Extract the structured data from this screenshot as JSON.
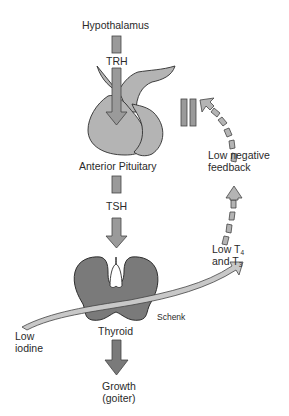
{
  "diagram": {
    "colors": {
      "pituitary_fill": "#b4b4b4",
      "thyroid_fill": "#7a7a7a",
      "arrow_fill": "#9a9a9a",
      "arrow_stroke": "#444444",
      "iodine_band_fill": "#c8c8c8",
      "outline": "#2e2e2e",
      "background": "#ffffff"
    },
    "labels": {
      "hypothalamus": "Hypothalamus",
      "trh": "TRH",
      "anterior_pituitary": "Anterior Pituitary",
      "tsh": "TSH",
      "thyroid": "Thyroid",
      "growth_line1": "Growth",
      "growth_line2": "(goiter)",
      "low_iodine_line1": "Low",
      "low_iodine_line2": "iodine",
      "low_t4_prefix": "Low T",
      "low_t4_sub": "4",
      "and_t3_prefix": "and T",
      "and_t3_sub": "3",
      "low_negative_feedback_line1": "Low negative",
      "low_negative_feedback_line2": "feedback",
      "artist_credit": "Schenk"
    },
    "nodes": [
      {
        "id": "hypothalamus",
        "label": "Hypothalamus"
      },
      {
        "id": "anterior_pituitary",
        "label": "Anterior Pituitary"
      },
      {
        "id": "thyroid",
        "label": "Thyroid"
      },
      {
        "id": "goiter",
        "label": "Growth (goiter)"
      }
    ],
    "edges": [
      {
        "from": "hypothalamus",
        "to": "anterior_pituitary",
        "label": "TRH",
        "style": "solid"
      },
      {
        "from": "anterior_pituitary",
        "to": "thyroid",
        "label": "TSH",
        "style": "solid"
      },
      {
        "from": "low_iodine",
        "to": "thyroid_output",
        "label": "Low T4 and T3",
        "style": "solid-curved"
      },
      {
        "from": "thyroid_output",
        "to": "anterior_pituitary",
        "label": "Low negative feedback",
        "style": "dashed-curved",
        "blocked_symbol": "‖"
      },
      {
        "from": "thyroid",
        "to": "goiter",
        "label": "",
        "style": "solid"
      }
    ]
  }
}
